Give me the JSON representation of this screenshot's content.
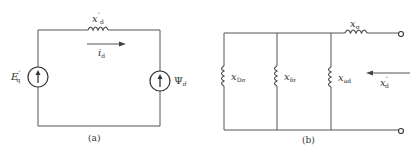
{
  "diagram_a": {
    "caption": "(a)",
    "reactance_label": {
      "symbol": "x",
      "superscript": "″",
      "subscript": "d"
    },
    "current_label": {
      "symbol": "i",
      "subscript": "d"
    },
    "left_source_label": {
      "symbol": "E",
      "superscript": "″",
      "subscript": "q"
    },
    "right_source_label": {
      "symbol": "Ψ",
      "subscript": "d"
    }
  },
  "diagram_b": {
    "caption": "(b)",
    "branches": [
      {
        "symbol": "x",
        "subscript": "Dσ"
      },
      {
        "symbol": "x",
        "subscript": "fσ"
      },
      {
        "symbol": "x",
        "subscript": "ad"
      }
    ],
    "series_label": {
      "symbol": "x",
      "subscript": "σ"
    },
    "equivalent_label": {
      "symbol": "x",
      "superscript": "″",
      "subscript": "d"
    }
  },
  "colors": {
    "line": "#555555",
    "text": "#333333",
    "background": "#ffffff"
  }
}
